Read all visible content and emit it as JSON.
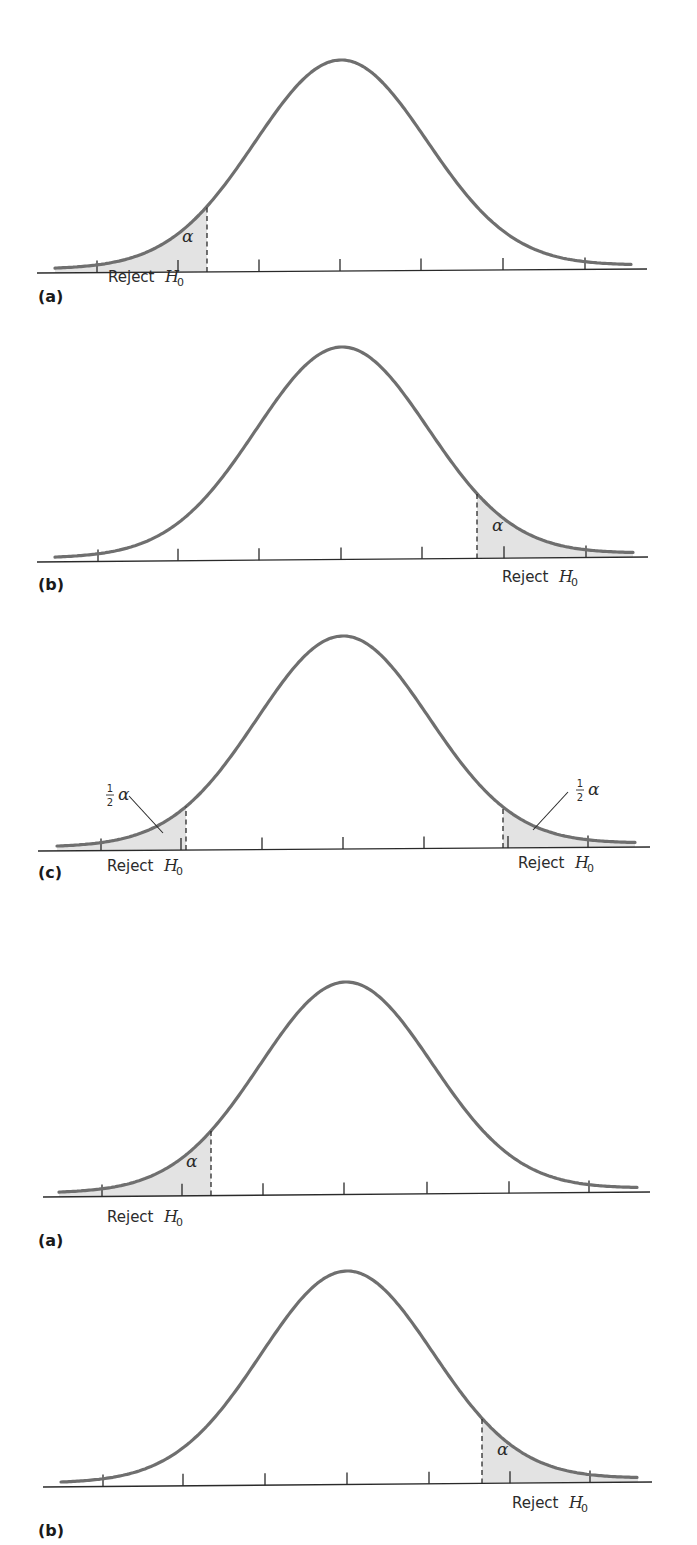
{
  "figure": {
    "reject_text": "Reject",
    "h_symbol": "H",
    "h_subscript": "0",
    "alpha_symbol": "α",
    "half_numerator": "1",
    "half_denominator": "2"
  },
  "colors": {
    "curve": "#6f6f6f",
    "rejection_fill": "#e3e3e3",
    "axis": "#2a2a2a"
  },
  "chart_data": [
    {
      "type": "area",
      "panel_label": "(a)",
      "title": "Left-tailed test",
      "distribution": "normal",
      "rejection_region": "left",
      "region_label": "Reject H0",
      "area_label": "α",
      "tick_count": 7,
      "geometry": {
        "axis": [
          37,
          273,
          647,
          269
        ],
        "peak": [
          341,
          60
        ],
        "sigma": 86,
        "x_range": [
          55,
          632
        ],
        "ticks": [
          97,
          178,
          259,
          340,
          421,
          503,
          585
        ],
        "cutoffs": [
          207
        ],
        "label_y": 302
      },
      "annotations": [
        {
          "text": "α",
          "x": 182,
          "y": 242
        }
      ],
      "reject_labels": [
        {
          "x": 108,
          "y": 282
        }
      ]
    },
    {
      "type": "area",
      "panel_label": "(b)",
      "title": "Right-tailed test",
      "distribution": "normal",
      "rejection_region": "right",
      "region_label": "Reject H0",
      "area_label": "α",
      "tick_count": 7,
      "geometry": {
        "axis": [
          37,
          562,
          648,
          557
        ],
        "peak": [
          342,
          347
        ],
        "sigma": 86,
        "x_range": [
          55,
          633
        ],
        "ticks": [
          98,
          178,
          259,
          341,
          422,
          504,
          586
        ],
        "cutoffs": [
          477
        ],
        "label_y": 590
      },
      "annotations": [
        {
          "text": "α",
          "x": 492,
          "y": 531
        }
      ],
      "reject_labels": [
        {
          "x": 502,
          "y": 582
        }
      ]
    },
    {
      "type": "area",
      "panel_label": "(c)",
      "title": "Two-tailed test",
      "distribution": "normal",
      "rejection_region": "both",
      "region_label": "Reject H0",
      "area_label": "½α",
      "tick_count": 7,
      "geometry": {
        "axis": [
          38,
          851,
          650,
          847
        ],
        "peak": [
          343,
          636
        ],
        "sigma": 86,
        "x_range": [
          57,
          635
        ],
        "ticks": [
          101,
          181,
          262,
          343,
          424,
          508,
          588
        ],
        "cutoffs": [
          186,
          503
        ],
        "label_y": 878
      },
      "annotations": [
        {
          "text": "½α",
          "x": 107,
          "y": 800,
          "leader": [
            129,
            796,
            163,
            833
          ]
        },
        {
          "text": "½α",
          "x": 577,
          "y": 795,
          "leader": [
            568,
            792,
            533,
            830
          ]
        }
      ],
      "reject_labels": [
        {
          "x": 107,
          "y": 871
        },
        {
          "x": 518,
          "y": 868
        }
      ]
    },
    {
      "type": "area",
      "panel_label": "(a)",
      "title": "Left-tailed test (repeat)",
      "distribution": "normal",
      "rejection_region": "left",
      "region_label": "Reject H0",
      "area_label": "α",
      "tick_count": 7,
      "geometry": {
        "axis": [
          43,
          1197,
          650,
          1192
        ],
        "peak": [
          346,
          982
        ],
        "sigma": 86,
        "x_range": [
          59,
          637
        ],
        "ticks": [
          102,
          182,
          263,
          344,
          427,
          509,
          589
        ],
        "cutoffs": [
          211
        ],
        "label_y": 1246
      },
      "annotations": [
        {
          "text": "α",
          "x": 186,
          "y": 1167
        }
      ],
      "reject_labels": [
        {
          "x": 107,
          "y": 1222
        }
      ]
    },
    {
      "type": "area",
      "panel_label": "(b)",
      "title": "Right-tailed test (repeat)",
      "distribution": "normal",
      "rejection_region": "right",
      "region_label": "Reject H0",
      "area_label": "α",
      "tick_count": 7,
      "geometry": {
        "axis": [
          43,
          1487,
          652,
          1482
        ],
        "peak": [
          347,
          1271
        ],
        "sigma": 86,
        "x_range": [
          61,
          638
        ],
        "ticks": [
          103,
          183,
          265,
          347,
          429,
          510,
          590
        ],
        "cutoffs": [
          482
        ],
        "label_y": 1536
      },
      "annotations": [
        {
          "text": "α",
          "x": 497,
          "y": 1455
        }
      ],
      "reject_labels": [
        {
          "x": 512,
          "y": 1508
        }
      ]
    }
  ]
}
